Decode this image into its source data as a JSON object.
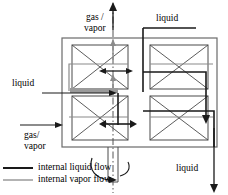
{
  "figure": {
    "type": "process-flow-diagram",
    "colors": {
      "liquid_flow": "#1a1a1a",
      "vapor_flow": "#8a8a8a",
      "vessel_outline": "#5a5a5a",
      "packing_outline": "#4a4a4a",
      "axis_line": "#555555",
      "distributor_band": "#9a9a9a",
      "background": "#ffffff"
    }
  },
  "labels": {
    "gas_vapor_outlet": "gas /\nvapor",
    "liquid_inlet_top": "liquid",
    "liquid_inlet_left": "liquid",
    "gas_vapor_inlet": "gas/\nvapor",
    "liquid_outlet_bottom": "liquid"
  },
  "legend": {
    "items": [
      {
        "label": "internal liquid flow",
        "color": "#1a1a1a",
        "width": 2.0
      },
      {
        "label": "internal vapor flow",
        "color": "#8a8a8a",
        "width": 1.3
      }
    ]
  },
  "structure": {
    "packing_beds": 4,
    "bed_marking": "x-cross diagonals",
    "rotation_axis": "vertical dash-dot centerline",
    "rotation_indicator": "curved arrow at shaft bottom",
    "distributor": "horizontal liquid distributor band at mid-height"
  }
}
